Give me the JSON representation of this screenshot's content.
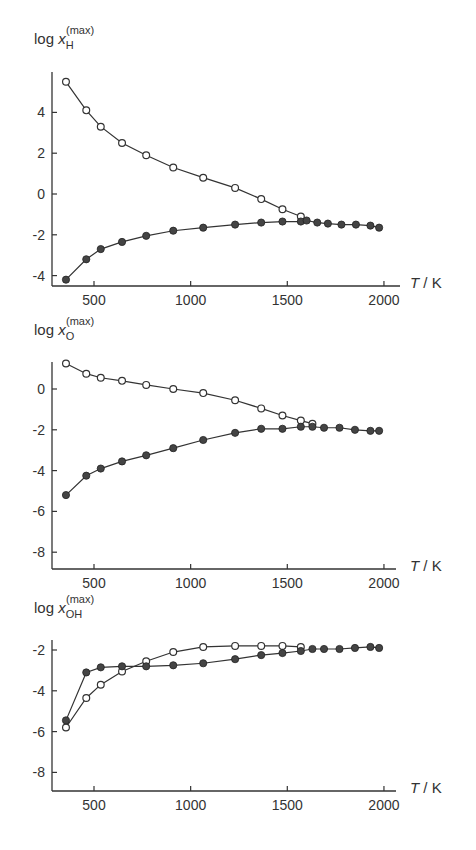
{
  "chart_data": [
    {
      "type": "line",
      "title": "",
      "ylabel": "log x_H^(max)",
      "ylabel_parts": {
        "prefix": "log x",
        "sub": "H",
        "sup": "(max)"
      },
      "xlabel": "T / K",
      "xticks": [
        500,
        1000,
        1500,
        2000
      ],
      "yticks": [
        4,
        2,
        0,
        -2,
        -4
      ],
      "xlim": [
        300,
        2100
      ],
      "ylim": [
        -4.4,
        6.0
      ],
      "series": [
        {
          "name": "open circles",
          "marker": "open-circle",
          "x": [
            355,
            460,
            535,
            645,
            770,
            910,
            1065,
            1230,
            1365,
            1475,
            1570
          ],
          "y": [
            5.5,
            4.1,
            3.3,
            2.5,
            1.9,
            1.3,
            0.8,
            0.3,
            -0.25,
            -0.75,
            -1.1
          ]
        },
        {
          "name": "filled circles",
          "marker": "filled-circle",
          "x": [
            355,
            460,
            535,
            645,
            770,
            910,
            1065,
            1230,
            1365,
            1475,
            1570,
            1600,
            1655,
            1710,
            1780,
            1855,
            1930,
            1975
          ],
          "y": [
            -4.2,
            -3.2,
            -2.7,
            -2.35,
            -2.05,
            -1.8,
            -1.65,
            -1.5,
            -1.4,
            -1.35,
            -1.35,
            -1.3,
            -1.4,
            -1.45,
            -1.5,
            -1.5,
            -1.55,
            -1.65
          ]
        }
      ]
    },
    {
      "type": "line",
      "title": "",
      "ylabel": "log x_O^(max)",
      "ylabel_parts": {
        "prefix": "log x",
        "sub": "O",
        "sup": "(max)"
      },
      "xlabel": "T / K",
      "xticks": [
        500,
        1000,
        1500,
        2000
      ],
      "yticks": [
        0,
        -2,
        -4,
        -6,
        -8
      ],
      "xlim": [
        300,
        2100
      ],
      "ylim": [
        -8.8,
        1.3
      ],
      "series": [
        {
          "name": "open circles",
          "marker": "open-circle",
          "x": [
            355,
            460,
            535,
            645,
            770,
            910,
            1065,
            1230,
            1365,
            1475,
            1570,
            1630
          ],
          "y": [
            1.25,
            0.75,
            0.55,
            0.4,
            0.2,
            0.0,
            -0.2,
            -0.55,
            -0.95,
            -1.3,
            -1.55,
            -1.7
          ]
        },
        {
          "name": "filled circles",
          "marker": "filled-circle",
          "x": [
            355,
            460,
            535,
            645,
            770,
            910,
            1065,
            1230,
            1365,
            1475,
            1570,
            1630,
            1690,
            1770,
            1850,
            1930,
            1975
          ],
          "y": [
            -5.2,
            -4.25,
            -3.9,
            -3.55,
            -3.25,
            -2.9,
            -2.5,
            -2.15,
            -1.95,
            -1.95,
            -1.85,
            -1.85,
            -1.9,
            -1.9,
            -2.0,
            -2.05,
            -2.05
          ]
        }
      ]
    },
    {
      "type": "line",
      "title": "",
      "ylabel": "log x_OH^(max)",
      "ylabel_parts": {
        "prefix": "log x",
        "sub": "OH",
        "sup": "(max)"
      },
      "xlabel": "T / K",
      "xticks": [
        500,
        1000,
        1500,
        2000
      ],
      "yticks": [
        -2,
        -4,
        -6,
        -8
      ],
      "xlim": [
        300,
        2100
      ],
      "ylim": [
        -9.0,
        -1.5
      ],
      "series": [
        {
          "name": "open circles",
          "marker": "open-circle",
          "x": [
            355,
            460,
            535,
            645,
            770,
            910,
            1065,
            1230,
            1365,
            1475,
            1570
          ],
          "y": [
            -5.8,
            -4.35,
            -3.7,
            -3.05,
            -2.55,
            -2.1,
            -1.85,
            -1.8,
            -1.8,
            -1.8,
            -1.85
          ]
        },
        {
          "name": "filled circles",
          "marker": "filled-circle",
          "x": [
            355,
            460,
            535,
            645,
            770,
            910,
            1065,
            1230,
            1365,
            1475,
            1570,
            1630,
            1690,
            1770,
            1850,
            1930,
            1975
          ],
          "y": [
            -5.45,
            -3.1,
            -2.85,
            -2.8,
            -2.8,
            -2.75,
            -2.65,
            -2.45,
            -2.25,
            -2.15,
            -2.05,
            -1.95,
            -1.95,
            -1.95,
            -1.9,
            -1.85,
            -1.9
          ]
        }
      ]
    }
  ],
  "charts": [
    {
      "ylabel_prefix": "log x",
      "ylabel_sub": "H",
      "ylabel_sup": "(max)",
      "xunit": "T / K",
      "xtick_labels": [
        "500",
        "1000",
        "1500",
        "2000"
      ],
      "ytick_labels": [
        "4",
        "2",
        "0",
        "-2",
        "-4"
      ]
    },
    {
      "ylabel_prefix": "log x",
      "ylabel_sub": "O",
      "ylabel_sup": "(max)",
      "xunit": "T / K",
      "xtick_labels": [
        "500",
        "1000",
        "1500",
        "2000"
      ],
      "ytick_labels": [
        "0",
        "-2",
        "-4",
        "-6",
        "-8"
      ]
    },
    {
      "ylabel_prefix": "log x",
      "ylabel_sub": "OH",
      "ylabel_sup": "(max)",
      "xunit": "T / K",
      "xtick_labels": [
        "500",
        "1000",
        "1500",
        "2000"
      ],
      "ytick_labels": [
        "-2",
        "-4",
        "-6",
        "-8"
      ]
    }
  ],
  "colors": {
    "ink": "#333333",
    "background": "#ffffff",
    "filled_marker": "#444444"
  }
}
